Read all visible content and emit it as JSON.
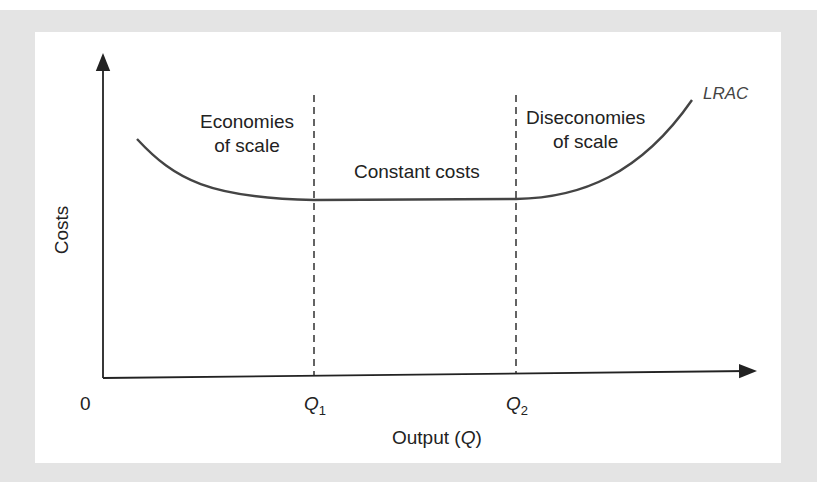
{
  "diagram": {
    "y_axis_label": "Costs",
    "x_axis_label_prefix": "Output (",
    "x_axis_label_var": "Q",
    "x_axis_label_suffix": ")",
    "origin_label": "0",
    "q1_label": "Q",
    "q1_sub": "1",
    "q2_label": "Q",
    "q2_sub": "2",
    "curve_label": "LRAC",
    "regions": {
      "left_line1": "Economies",
      "left_line2": "of scale",
      "middle": "Constant costs",
      "right_line1": "Diseconomies",
      "right_line2": "of scale"
    }
  }
}
